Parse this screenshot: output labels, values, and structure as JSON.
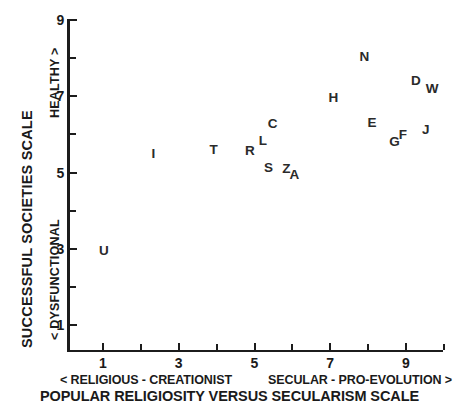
{
  "chart_data": {
    "type": "scatter",
    "title": "",
    "xlabel": "POPULAR RELIGIOSITY VERSUS SECULARISM SCALE",
    "ylabel": "SUCCESSFUL SOCIETIES SCALE",
    "xlim": [
      0.4,
      9.9
    ],
    "ylim": [
      0.5,
      9.0
    ],
    "xticks": [
      1,
      3,
      5,
      7,
      9
    ],
    "yticks": [
      1,
      3,
      5,
      7,
      9
    ],
    "xtick_labels": [
      "1",
      "3",
      "5",
      "7",
      "9"
    ],
    "ytick_labels": [
      "1",
      "3",
      "5",
      "7",
      "9"
    ],
    "minor_ticks": true,
    "grid": false,
    "legend": null,
    "x_axis_left_caption": "< RELIGIOUS - CREATIONIST",
    "x_axis_right_caption": "SECULAR - PRO-EVOLUTION >",
    "y_axis_low_caption": "< DYSFUNCTIONAL",
    "y_axis_high_caption": "HEALTHY >",
    "marker_style": "letter",
    "points": [
      {
        "label": "U",
        "x": 1.02,
        "y": 2.95
      },
      {
        "label": "I",
        "x": 2.33,
        "y": 5.48
      },
      {
        "label": "T",
        "x": 3.92,
        "y": 5.59
      },
      {
        "label": "R",
        "x": 4.88,
        "y": 5.56
      },
      {
        "label": "L",
        "x": 5.22,
        "y": 5.83
      },
      {
        "label": "C",
        "x": 5.48,
        "y": 6.28
      },
      {
        "label": "S",
        "x": 5.37,
        "y": 5.11
      },
      {
        "label": "Z",
        "x": 5.84,
        "y": 5.09
      },
      {
        "label": "A",
        "x": 6.05,
        "y": 4.93
      },
      {
        "label": "H",
        "x": 7.08,
        "y": 6.95
      },
      {
        "label": "N",
        "x": 7.9,
        "y": 8.04
      },
      {
        "label": "E",
        "x": 8.1,
        "y": 6.29
      },
      {
        "label": "G",
        "x": 8.7,
        "y": 5.8
      },
      {
        "label": "F",
        "x": 8.92,
        "y": 5.98
      },
      {
        "label": "D",
        "x": 9.26,
        "y": 7.4
      },
      {
        "label": "W",
        "x": 9.69,
        "y": 7.18
      },
      {
        "label": "J",
        "x": 9.52,
        "y": 6.11
      }
    ]
  }
}
